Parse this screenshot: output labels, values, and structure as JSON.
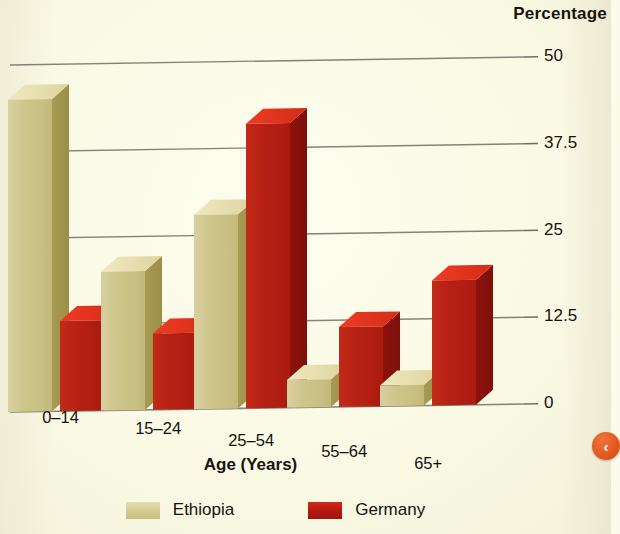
{
  "chart_data": {
    "type": "bar",
    "title": "",
    "xlabel": "Age (Years)",
    "ylabel": "Percentage",
    "categories": [
      "0–14",
      "15–24",
      "25–54",
      "55–64",
      "65+"
    ],
    "series": [
      {
        "name": "Ethiopia",
        "color": "#cfc68a",
        "values": [
          45,
          20,
          28,
          4,
          3
        ]
      },
      {
        "name": "Germany",
        "color": "#b4180f",
        "values": [
          13,
          11,
          41,
          11.5,
          18
        ]
      }
    ],
    "yticks": [
      "0",
      "12.5",
      "25",
      "37.5",
      "50"
    ],
    "ylim": [
      0,
      50
    ],
    "grid": true,
    "legend_position": "bottom",
    "style": "3d-bars"
  },
  "axis": {
    "y_title": "Percentage",
    "x_title": "Age (Years)",
    "yticks": [
      {
        "label": "50",
        "value": 50
      },
      {
        "label": "37.5",
        "value": 37.5
      },
      {
        "label": "25",
        "value": 25
      },
      {
        "label": "12.5",
        "value": 12.5
      },
      {
        "label": "0",
        "value": 0
      }
    ],
    "xticks": [
      "0–14",
      "15–24",
      "25–54",
      "55–64",
      "65+"
    ]
  },
  "legend": {
    "items": [
      {
        "label": "Ethiopia",
        "color": "#cfc68a"
      },
      {
        "label": "Germany",
        "color": "#b4180f"
      }
    ]
  },
  "nav": {
    "prev_label": "‹"
  },
  "colors": {
    "background": "#fbfbe9",
    "ethiopia": "#cfc68a",
    "germany": "#b4180f",
    "gridline": "#6f6f67",
    "text": "#14120d",
    "nav_button": "#e2591f"
  }
}
